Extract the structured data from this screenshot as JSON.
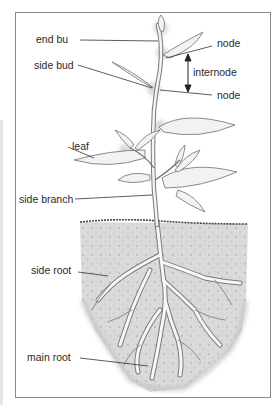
{
  "diagram": {
    "labels": {
      "end_bud": "end bu",
      "side_bud": "side bud",
      "node_top": "node",
      "internode": "internode",
      "node_bottom": "node",
      "leaf": "leaf",
      "side_branch": "side branch",
      "side_root": "side root",
      "main_root": "main root"
    },
    "colors": {
      "frame": "#8a8a8a",
      "line": "#333333",
      "stem": "#f4f4f4",
      "outline": "#7a7a7a",
      "soil": "#d9d9d9",
      "bud_glow": "#dcdcdc"
    }
  }
}
